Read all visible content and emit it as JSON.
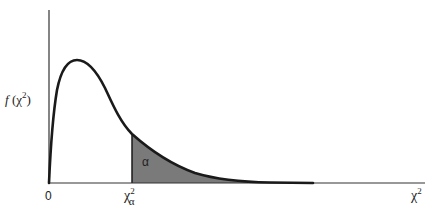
{
  "diagram": {
    "y_label": {
      "func": "f",
      "open": " (",
      "var": "χ",
      "exp": "2",
      "close": ")"
    },
    "x_origin_label": "0",
    "critical_value_label": {
      "var": "χ",
      "exp": "2",
      "sub": "α"
    },
    "x_axis_label": {
      "var": "χ",
      "exp": "2"
    },
    "tail_area_label": "α",
    "colors": {
      "curve": "#1a1a1a",
      "axis": "#333333",
      "tail_fill": "#7a7a7a",
      "background": "#ffffff"
    }
  }
}
